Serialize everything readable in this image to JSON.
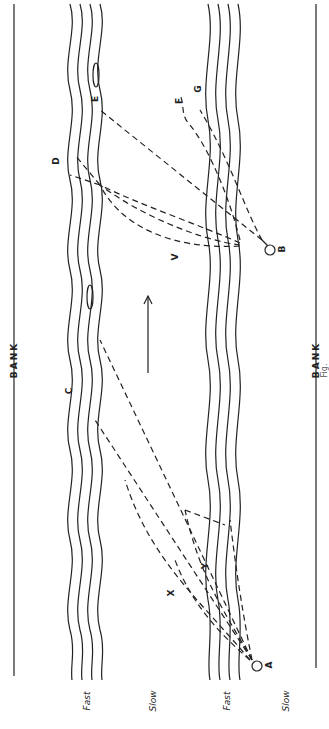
{
  "figure": {
    "orientation": "rotated-90-ccw",
    "banks": {
      "left_label": "BANK",
      "right_label": "BANK"
    },
    "zones": [
      "Fast",
      "Slow",
      "Fast",
      "Slow"
    ],
    "points": {
      "start": {
        "name": "A"
      },
      "target": {
        "name": "B"
      }
    },
    "path_labels": [
      "C",
      "D",
      "E",
      "F",
      "G",
      "X",
      "Y",
      "V"
    ],
    "flow_direction": "current-arrow",
    "caption_partial": "Fig."
  },
  "colors": {
    "ink": "#222222",
    "paper": "#ffffff"
  }
}
